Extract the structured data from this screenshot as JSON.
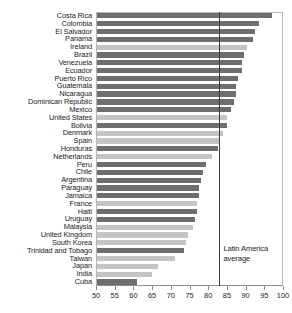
{
  "chart_data": {
    "type": "bar",
    "orientation": "horizontal",
    "title": "",
    "subtitle": "",
    "xlabel": "",
    "ylabel": "",
    "xlim": [
      50,
      100
    ],
    "xticks": [
      50,
      55,
      60,
      65,
      70,
      75,
      80,
      85,
      90,
      95,
      100
    ],
    "grid": false,
    "legend": "none",
    "annotation": {
      "text": "Latin America\naverage",
      "line_value": 83
    },
    "colors": {
      "latin_america": "#6e6e6e",
      "other": "#c4c4c4",
      "reference_line": "#3d3d3d",
      "axis": "#8c8c8c",
      "text": "#1a1a1a",
      "background": "#ffffff"
    },
    "categories": [
      "Costa Rica",
      "Colombia",
      "El Salvador",
      "Panama",
      "Ireland",
      "Brazil",
      "Venezuela",
      "Ecuador",
      "Puerto Rico",
      "Guatemala",
      "Nicaragua",
      "Dominican Republic",
      "Mexico",
      "United States",
      "Bolivia",
      "Denmark",
      "Spain",
      "Honduras",
      "Netherlands",
      "Peru",
      "Chile",
      "Argentina",
      "Paraguay",
      "Jamaica",
      "France",
      "Haiti",
      "Uruguay",
      "Malaysia",
      "United Kingdom",
      "South Korea",
      "Trinidad and Tobago",
      "Taiwan",
      "Japan",
      "India",
      "Cuba"
    ],
    "values": [
      97.0,
      93.5,
      92.5,
      92.0,
      90.5,
      89.5,
      89.0,
      89.0,
      88.0,
      87.5,
      87.5,
      87.0,
      86.0,
      85.0,
      85.0,
      84.0,
      83.0,
      82.5,
      81.0,
      79.5,
      78.5,
      78.0,
      77.5,
      77.5,
      77.0,
      77.0,
      76.5,
      76.0,
      74.5,
      74.0,
      73.5,
      71.0,
      66.5,
      65.0,
      61.0
    ],
    "groups": [
      "latin_america",
      "latin_america",
      "latin_america",
      "latin_america",
      "other",
      "latin_america",
      "latin_america",
      "latin_america",
      "latin_america",
      "latin_america",
      "latin_america",
      "latin_america",
      "latin_america",
      "other",
      "latin_america",
      "other",
      "other",
      "latin_america",
      "other",
      "latin_america",
      "latin_america",
      "latin_america",
      "latin_america",
      "latin_america",
      "other",
      "latin_america",
      "latin_america",
      "other",
      "other",
      "other",
      "latin_america",
      "other",
      "other",
      "other",
      "latin_america"
    ]
  }
}
